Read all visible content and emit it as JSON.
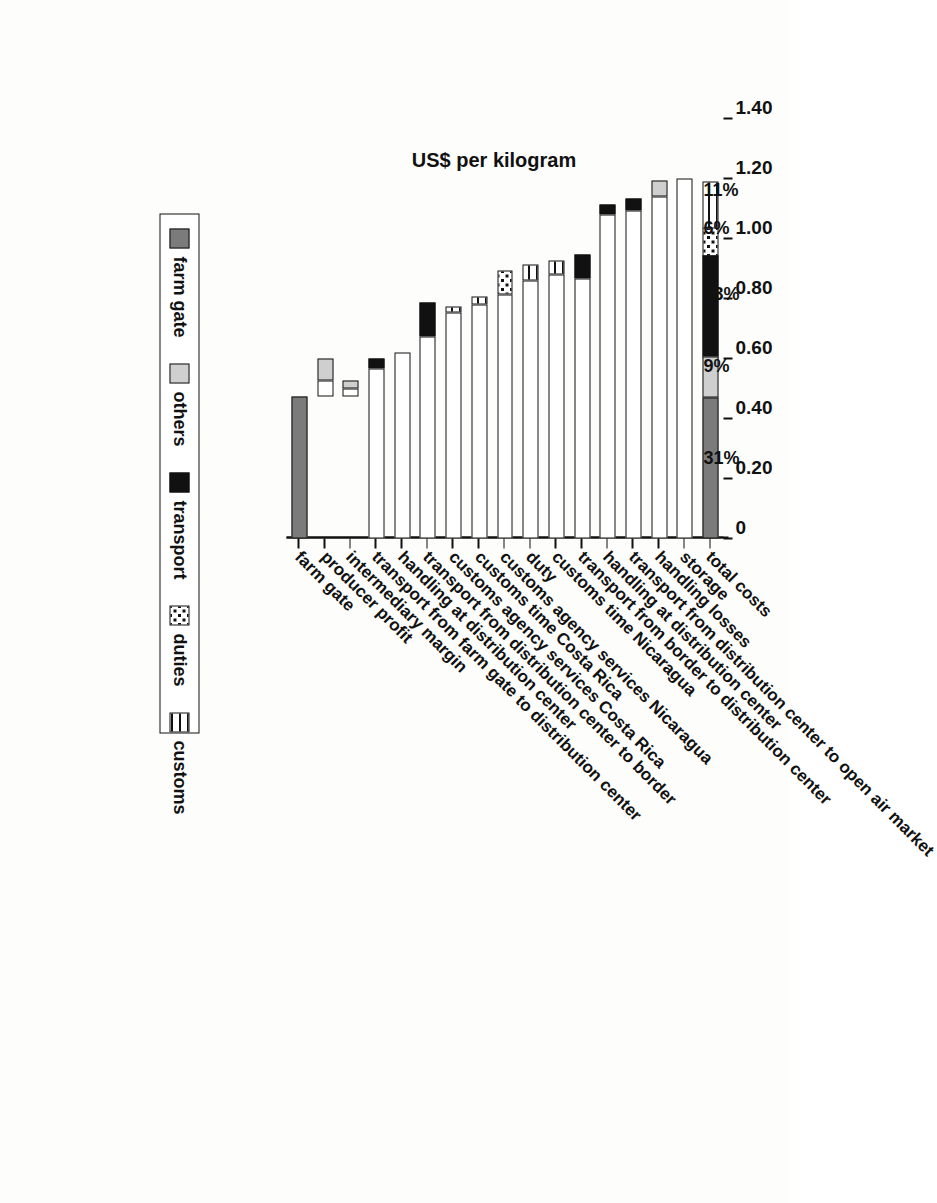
{
  "chart_data": {
    "type": "bar",
    "subtype": "horizontal-stacked",
    "title": "",
    "xlabel": "US$ per kilogram",
    "ylabel": "",
    "xlim": [
      0,
      1.4
    ],
    "xticks": [
      "0",
      "0.20",
      "0.40",
      "0.60",
      "0.80",
      "1.00",
      "1.20",
      "1.40"
    ],
    "xtick_values": [
      0,
      0.2,
      0.4,
      0.6,
      0.8,
      1.0,
      1.2,
      1.4
    ],
    "grid": false,
    "legend_position": "bottom",
    "legend": [
      {
        "name": "farm gate",
        "fill": "solid-dark-gray",
        "color": "#7b7b7b"
      },
      {
        "name": "others",
        "fill": "solid-light-gray",
        "color": "#cfcfcf"
      },
      {
        "name": "transport",
        "fill": "solid-black",
        "color": "#111111"
      },
      {
        "name": "duties",
        "fill": "checkered-dots",
        "color": "#ffffff"
      },
      {
        "name": "customs",
        "fill": "horizontal-lines",
        "color": "#ffffff"
      }
    ],
    "categories": [
      "farm gate",
      "producer profit",
      "intermediary margin",
      "transport from farm gate to distribution center",
      "handling at distribution center",
      "transport from distribution center to border",
      "customs agency services Costa Rica",
      "customs time Costa Rica",
      "customs agency services Nicaragua",
      "duty",
      "customs time Nicaragua",
      "transport from border to distribution center",
      "handling at distribution center",
      "transport from distribution center to open air market",
      "handling losses",
      "storage",
      "total costs"
    ],
    "bars": [
      {
        "category": "farm gate",
        "start": 0.0,
        "end": 0.473,
        "segments": [
          {
            "series": "farm gate",
            "from": 0.0,
            "to": 0.473
          }
        ]
      },
      {
        "category": "producer profit",
        "start": 0.473,
        "end": 0.6,
        "segments": [
          {
            "series": "value",
            "from": 0.473,
            "to": 0.527
          },
          {
            "series": "others",
            "from": 0.527,
            "to": 0.6
          }
        ]
      },
      {
        "category": "intermediary margin",
        "start": 0.473,
        "end": 0.527,
        "segments": [
          {
            "series": "value",
            "from": 0.473,
            "to": 0.5
          },
          {
            "series": "others",
            "from": 0.5,
            "to": 0.527
          }
        ]
      },
      {
        "category": "transport from farm gate to distribution center",
        "start": 0.0,
        "end": 0.6,
        "segments": [
          {
            "series": "value",
            "from": 0.0,
            "to": 0.567
          },
          {
            "series": "transport",
            "from": 0.567,
            "to": 0.6
          }
        ]
      },
      {
        "category": "handling at distribution center",
        "start": 0.0,
        "end": 0.62,
        "segments": [
          {
            "series": "value",
            "from": 0.0,
            "to": 0.62
          }
        ]
      },
      {
        "category": "transport from distribution center to border",
        "start": 0.0,
        "end": 0.787,
        "segments": [
          {
            "series": "value",
            "from": 0.0,
            "to": 0.673
          },
          {
            "series": "transport",
            "from": 0.673,
            "to": 0.787
          }
        ]
      },
      {
        "category": "customs agency services Costa Rica",
        "start": 0.0,
        "end": 0.773,
        "segments": [
          {
            "series": "value",
            "from": 0.0,
            "to": 0.753
          },
          {
            "series": "customs",
            "from": 0.753,
            "to": 0.773
          }
        ]
      },
      {
        "category": "customs time Costa Rica",
        "start": 0.0,
        "end": 0.807,
        "segments": [
          {
            "series": "value",
            "from": 0.0,
            "to": 0.78
          },
          {
            "series": "customs",
            "from": 0.78,
            "to": 0.807
          }
        ]
      },
      {
        "category": "customs agency services Nicaragua",
        "start": 0.0,
        "end": 0.893,
        "segments": [
          {
            "series": "value",
            "from": 0.0,
            "to": 0.813
          },
          {
            "series": "duties",
            "from": 0.813,
            "to": 0.893
          }
        ]
      },
      {
        "category": "duty",
        "start": 0.0,
        "end": 0.913,
        "segments": [
          {
            "series": "value",
            "from": 0.0,
            "to": 0.86
          },
          {
            "series": "customs",
            "from": 0.86,
            "to": 0.913
          }
        ]
      },
      {
        "category": "customs time Nicaragua",
        "start": 0.0,
        "end": 0.927,
        "segments": [
          {
            "series": "value",
            "from": 0.0,
            "to": 0.88
          },
          {
            "series": "customs",
            "from": 0.88,
            "to": 0.927
          }
        ]
      },
      {
        "category": "transport from border to distribution center",
        "start": 0.0,
        "end": 0.947,
        "segments": [
          {
            "series": "value",
            "from": 0.0,
            "to": 0.867
          },
          {
            "series": "transport",
            "from": 0.867,
            "to": 0.947
          }
        ]
      },
      {
        "category": "handling at distribution center",
        "start": 0.0,
        "end": 1.113,
        "segments": [
          {
            "series": "value",
            "from": 0.0,
            "to": 1.08
          },
          {
            "series": "transport",
            "from": 1.08,
            "to": 1.113
          }
        ]
      },
      {
        "category": "transport from distribution center to open air market",
        "start": 0.0,
        "end": 1.133,
        "segments": [
          {
            "series": "value",
            "from": 0.0,
            "to": 1.093
          },
          {
            "series": "transport",
            "from": 1.093,
            "to": 1.133
          }
        ]
      },
      {
        "category": "handling losses",
        "start": 0.0,
        "end": 1.193,
        "segments": [
          {
            "series": "value",
            "from": 0.0,
            "to": 1.14
          },
          {
            "series": "others",
            "from": 1.14,
            "to": 1.193
          }
        ]
      },
      {
        "category": "storage",
        "start": 0.0,
        "end": 1.2,
        "segments": [
          {
            "series": "value",
            "from": 0.0,
            "to": 1.2
          }
        ]
      },
      {
        "category": "total costs",
        "start": 0.0,
        "end": 1.207,
        "segments": [
          {
            "series": "farm gate",
            "from": 0.0,
            "to": 0.47
          },
          {
            "series": "others",
            "from": 0.47,
            "to": 0.607
          },
          {
            "series": "transport",
            "from": 0.607,
            "to": 0.95
          },
          {
            "series": "duties",
            "from": 0.95,
            "to": 1.047
          },
          {
            "series": "customs",
            "from": 1.047,
            "to": 1.207
          }
        ]
      }
    ],
    "percent_labels": [
      {
        "text": "31%",
        "series": "farm gate",
        "at": 0.235
      },
      {
        "text": "9%",
        "series": "others",
        "at": 0.539
      },
      {
        "text": "23%",
        "series": "transport",
        "at": 0.779
      },
      {
        "text": "6%",
        "series": "duties",
        "at": 0.999
      },
      {
        "text": "11%",
        "series": "customs",
        "at": 1.127
      }
    ]
  }
}
